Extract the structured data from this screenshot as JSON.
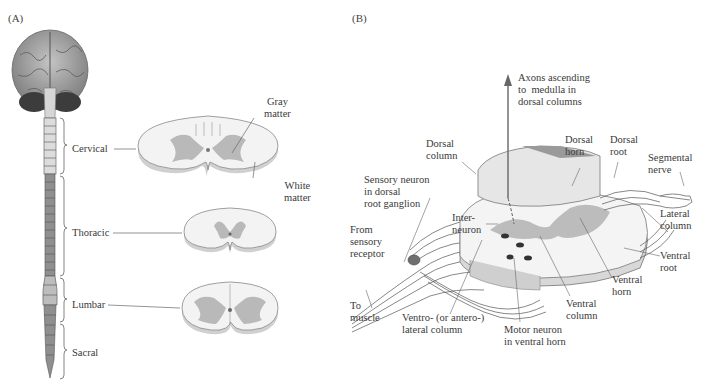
{
  "panels": {
    "a": {
      "label": "(A)",
      "regions": [
        {
          "name": "Cervical"
        },
        {
          "name": "Thoracic"
        },
        {
          "name": "Lumbar"
        },
        {
          "name": "Sacral"
        }
      ],
      "annotations": {
        "gray_matter": "Gray\nmatter",
        "white_matter": "White\nmatter"
      }
    },
    "b": {
      "label": "(B)",
      "annotations": {
        "axons": "Axons ascending\nto  medulla in\ndorsal columns",
        "dorsal_column": "Dorsal\ncolumn",
        "dorsal_horn": "Dorsal\nhorn",
        "dorsal_root": "Dorsal\nroot",
        "segmental_nerve": "Segmental\nnerve",
        "sensory_neuron": "Sensory neuron\nin dorsal\nroot ganglion",
        "lateral_column": "Lateral\ncolumn",
        "interneuron": "Inter-\nneuron",
        "from_sensory": "From\nsensory\nreceptor",
        "ventral_root": "Ventral\nroot",
        "ventral_horn": "Ventral\nhorn",
        "ventral_column": "Ventral\ncolumn",
        "to_muscle": "To\nmuscle",
        "ventrolateral": "Ventro- (or antero-)\nlateral column",
        "motor_neuron": "Motor neuron\nin ventral horn"
      }
    }
  },
  "colors": {
    "gray_matter": "#b9b9b9",
    "white_matter": "#f1f1f1",
    "outline": "#777777",
    "brain": "#9a9a9a",
    "cerebellum": "#3c3c3c",
    "cord_light": "#d9d9d9",
    "cord_dark": "#8d8d8d"
  }
}
